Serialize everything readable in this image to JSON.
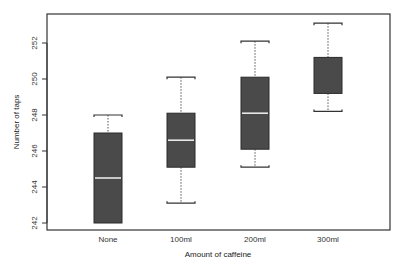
{
  "chart_data": {
    "type": "boxplot",
    "title": "",
    "xlabel": "Amount of caffeine",
    "ylabel": "Number of taps",
    "categories": [
      "None",
      "100ml",
      "200ml",
      "300ml"
    ],
    "ylim": [
      241.6,
      253.9
    ],
    "yticks": [
      242,
      244,
      246,
      248,
      250,
      252
    ],
    "grid": false,
    "legend": null,
    "box_color": "#4a4a4a",
    "median_color": "#e8e8e8",
    "boxes": [
      {
        "label": "None",
        "whisker_low": 242.0,
        "q1": 242.0,
        "median": 244.5,
        "q3": 247.0,
        "whisker_high": 248.0
      },
      {
        "label": "100ml",
        "whisker_low": 243.1,
        "q1": 245.1,
        "median": 246.6,
        "q3": 248.1,
        "whisker_high": 250.1
      },
      {
        "label": "200ml",
        "whisker_low": 245.1,
        "q1": 246.1,
        "median": 248.1,
        "q3": 250.1,
        "whisker_high": 252.1
      },
      {
        "label": "300ml",
        "whisker_low": 248.2,
        "q1": 249.2,
        "median": 251.2,
        "q3": 251.2,
        "whisker_high": 253.1
      }
    ]
  },
  "axes": {
    "x_title": "Amount of caffeine",
    "y_title": "Number of taps"
  }
}
